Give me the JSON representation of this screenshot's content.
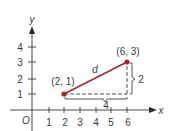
{
  "diagram": {
    "axes": {
      "x_label": "x",
      "y_label": "y",
      "origin_label": "O",
      "x_ticks": [
        "1",
        "2",
        "3",
        "4",
        "5",
        "6"
      ],
      "y_ticks": [
        "1",
        "2",
        "3",
        "4"
      ]
    },
    "points": [
      {
        "label": "(2, 1)",
        "x": 2,
        "y": 1
      },
      {
        "label": "(6, 3)",
        "x": 6,
        "y": 3
      }
    ],
    "segment_label": "d",
    "horizontal_leg_label": "4",
    "vertical_leg_label": "2",
    "colors": {
      "segment": "#9b2b2b",
      "axes": "#4a4a4a",
      "dashed": "#555555"
    }
  }
}
